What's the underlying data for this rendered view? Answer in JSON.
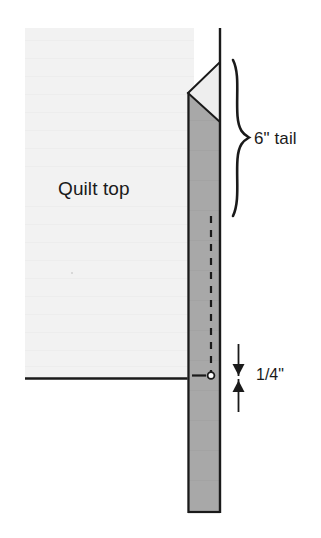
{
  "diagram": {
    "labels": {
      "quilt_top": "Quilt top",
      "tail_length": "6\" tail",
      "seam_allowance": "1/4\""
    },
    "annotations": {
      "brace_name": "curly-brace",
      "quarter_inch_arrow": "double-headed-vertical-arrow",
      "stitch_line": "dashed-stitching-line",
      "start_marker": "stitch-start-dot",
      "folded_corner": "angled-fold-triangle"
    },
    "colors": {
      "quilt_top_fill": "#f2f2f2",
      "binding_strip_fill": "#a8a8a8",
      "fold_triangle_fill": "#eeeeee",
      "outline": "#1a1a1a",
      "text": "#1a1a1a",
      "background": "#ffffff"
    },
    "geometry": {
      "quilt_top_rect": [
        25,
        28,
        194,
        378
      ],
      "binding_strip_rect": [
        187,
        62,
        220,
        513
      ],
      "edge_line_x": 220,
      "edge_line_top": 28,
      "quilt_bottom_edge_y": 378,
      "stitch_line_x": 211,
      "stitch_line_top": 218,
      "stitch_line_bottom": 375,
      "brace_top": 60,
      "brace_bottom": 216
    }
  }
}
